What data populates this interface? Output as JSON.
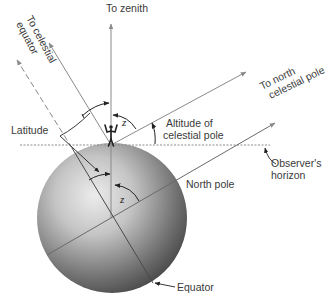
{
  "figure": {
    "type": "diagram",
    "labels": {
      "zenith": "To zenith",
      "celestial_equator_line1": "To celestial",
      "celestial_equator_line2": "equator",
      "north_celestial_pole_line1": "To north",
      "north_celestial_pole_line2": "celestial pole",
      "altitude_line1": "Altitude of",
      "altitude_line2": "celestial pole",
      "latitude": "Latitude",
      "horizon_line1": "Observer's",
      "horizon_line2": "horizon",
      "north_pole": "North pole",
      "equator": "Equator",
      "angle_z_upper": "z",
      "angle_z_lower": "z"
    },
    "colors": {
      "line": "#8a8a8a",
      "dark_line": "#333333",
      "sphere_light": "#e6e6e6",
      "sphere_dark": "#4a4a4a"
    }
  }
}
